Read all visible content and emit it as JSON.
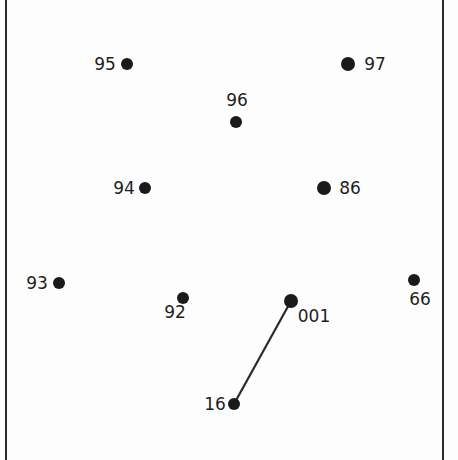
{
  "puzzle": {
    "type": "connect-the-dots",
    "orientation": "rotated-180",
    "dot_color": "#1a1a1a",
    "line_color": "#2a2a2a",
    "border_color": "#2a2a2a",
    "dots": [
      {
        "number": "91",
        "shown_as": "16",
        "x": 234,
        "y": 404,
        "r": 6,
        "label_x": 215,
        "label_y": 410,
        "anchor": "middle"
      },
      {
        "number": "92",
        "shown_as": "92",
        "x": 183,
        "y": 298,
        "r": 6,
        "label_x": 175,
        "label_y": 318,
        "anchor": "middle"
      },
      {
        "number": "93",
        "shown_as": "93",
        "x": 59,
        "y": 283,
        "r": 6,
        "label_x": 37,
        "label_y": 289,
        "anchor": "middle"
      },
      {
        "number": "94",
        "shown_as": "94",
        "x": 145,
        "y": 188,
        "r": 6,
        "label_x": 124,
        "label_y": 194,
        "anchor": "middle"
      },
      {
        "number": "95",
        "shown_as": "95",
        "x": 127,
        "y": 64,
        "r": 6,
        "label_x": 105,
        "label_y": 70,
        "anchor": "middle"
      },
      {
        "number": "96",
        "shown_as": "96",
        "x": 236,
        "y": 122,
        "r": 6,
        "label_x": 237,
        "label_y": 106,
        "anchor": "middle"
      },
      {
        "number": "97",
        "shown_as": "97",
        "x": 348,
        "y": 64,
        "r": 7,
        "label_x": 375,
        "label_y": 70,
        "anchor": "middle"
      },
      {
        "number": "98",
        "shown_as": "86",
        "x": 324,
        "y": 188,
        "r": 7,
        "label_x": 350,
        "label_y": 194,
        "anchor": "middle"
      },
      {
        "number": "99",
        "shown_as": "66",
        "x": 414,
        "y": 280,
        "r": 6,
        "label_x": 420,
        "label_y": 305,
        "anchor": "middle"
      },
      {
        "number": "100",
        "shown_as": "001",
        "x": 291,
        "y": 301,
        "r": 7,
        "label_x": 314,
        "label_y": 322,
        "anchor": "middle"
      }
    ],
    "lines": [
      {
        "from": "100",
        "to": "91",
        "x1": 291,
        "y1": 301,
        "x2": 234,
        "y2": 404
      }
    ]
  }
}
